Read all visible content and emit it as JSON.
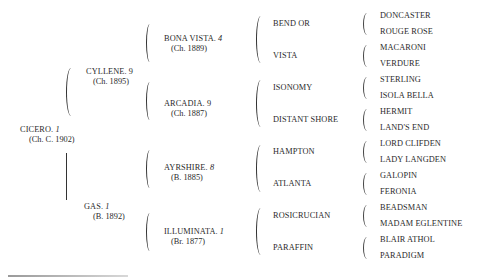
{
  "subject": {
    "name": "CICERO.",
    "num": "1",
    "detail": "(Ch. C. 1902)"
  },
  "sire": {
    "name": "CYLLENE.",
    "num": "9",
    "detail": "(Ch. 1895)"
  },
  "dam": {
    "name": "GAS.",
    "num": "1",
    "detail": "(B. 1892)"
  },
  "grandparents": [
    {
      "name": "BONA VISTA.",
      "num": "4",
      "detail": "(Ch. 1889)"
    },
    {
      "name": "ARCADIA.",
      "num": "9",
      "detail": "(Ch. 1887)"
    },
    {
      "name": "AYRSHIRE.",
      "num": "8",
      "detail": "(B. 1885)"
    },
    {
      "name": "ILLUMINATA.",
      "num": "1",
      "detail": "(Br. 1877)"
    }
  ],
  "great_grandparents": [
    "BEND OR",
    "VISTA",
    "ISONOMY",
    "DISTANT SHORE",
    "HAMPTON",
    "ATLANTA",
    "ROSICRUCIAN",
    "PARAFFIN"
  ],
  "great_great_grandparents": [
    "DONCASTER",
    "ROUGE ROSE",
    "MACARONI",
    "VERDURE",
    "STERLING",
    "ISOLA BELLA",
    "HERMIT",
    "LAND'S END",
    "LORD CLIFDEN",
    "LADY LANGDEN",
    "GALOPIN",
    "FERONIA",
    "BEADSMAN",
    "MADAM EGLENTINE",
    "BLAIR ATHOL",
    "PARADIGM"
  ]
}
